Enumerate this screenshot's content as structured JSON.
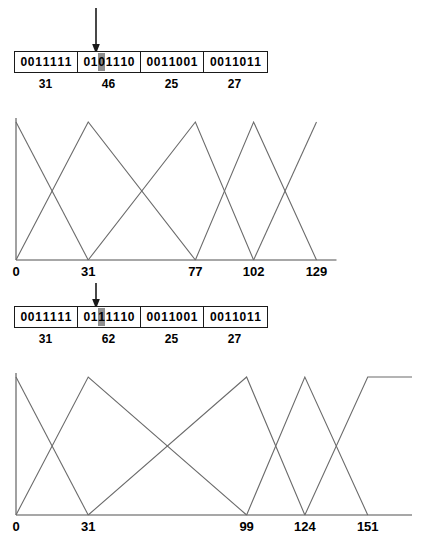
{
  "figure": {
    "background": "#ffffff",
    "line_color": "#6b6b6b",
    "axis_color": "#8a8a8a",
    "text_color": "#000000",
    "highlight_color": "#8f8f8f"
  },
  "before": {
    "arrow": {
      "name": "mutation-arrow",
      "glyph": "down-arrow"
    },
    "chromosome": {
      "genes": [
        {
          "bits": "0011111",
          "highlight_index": -1,
          "decoded": "31"
        },
        {
          "bits": "0101110",
          "highlight_index": 2,
          "decoded": "46"
        },
        {
          "bits": "0011001",
          "highlight_index": -1,
          "decoded": "25"
        },
        {
          "bits": "0011011",
          "highlight_index": -1,
          "decoded": "27"
        }
      ]
    },
    "chart_data": {
      "type": "line",
      "title": "",
      "xlabel": "",
      "ylabel": "",
      "grid": false,
      "legend": null,
      "xlim": [
        0,
        170
      ],
      "ylim": [
        0,
        1
      ],
      "tick_labels": [
        "0",
        "31",
        "77",
        "102",
        "129"
      ],
      "tick_values": [
        0,
        31,
        77,
        102,
        129
      ],
      "series": [
        {
          "name": "mf-1",
          "x": [
            0,
            31
          ],
          "y": [
            1,
            0
          ]
        },
        {
          "name": "mf-2",
          "x": [
            0,
            31,
            77
          ],
          "y": [
            0,
            1,
            0
          ]
        },
        {
          "name": "mf-3",
          "x": [
            31,
            77,
            102
          ],
          "y": [
            0,
            1,
            0
          ]
        },
        {
          "name": "mf-4",
          "x": [
            77,
            102,
            129
          ],
          "y": [
            0,
            1,
            0
          ]
        },
        {
          "name": "mf-5",
          "x": [
            102,
            129
          ],
          "y": [
            0,
            1
          ]
        }
      ]
    }
  },
  "after": {
    "arrow": {
      "name": "mutation-arrow",
      "glyph": "down-arrow"
    },
    "chromosome": {
      "genes": [
        {
          "bits": "0011111",
          "highlight_index": -1,
          "decoded": "31"
        },
        {
          "bits": "0111110",
          "highlight_index": 2,
          "decoded": "62"
        },
        {
          "bits": "0011001",
          "highlight_index": -1,
          "decoded": "25"
        },
        {
          "bits": "0011011",
          "highlight_index": -1,
          "decoded": "27"
        }
      ]
    },
    "chart_data": {
      "type": "line",
      "title": "",
      "xlabel": "",
      "ylabel": "",
      "grid": false,
      "legend": null,
      "xlim": [
        0,
        170
      ],
      "ylim": [
        0,
        1
      ],
      "tick_labels": [
        "0",
        "31",
        "99",
        "124",
        "151"
      ],
      "tick_values": [
        0,
        31,
        99,
        124,
        151
      ],
      "series": [
        {
          "name": "mf-1",
          "x": [
            0,
            31
          ],
          "y": [
            1,
            0
          ]
        },
        {
          "name": "mf-2",
          "x": [
            0,
            31,
            99
          ],
          "y": [
            0,
            1,
            0
          ]
        },
        {
          "name": "mf-3",
          "x": [
            31,
            99,
            124
          ],
          "y": [
            0,
            1,
            0
          ]
        },
        {
          "name": "mf-4",
          "x": [
            99,
            124,
            151
          ],
          "y": [
            0,
            1,
            0
          ]
        },
        {
          "name": "mf-5",
          "x": [
            124,
            151,
            170
          ],
          "y": [
            0,
            1,
            1
          ]
        }
      ]
    }
  }
}
